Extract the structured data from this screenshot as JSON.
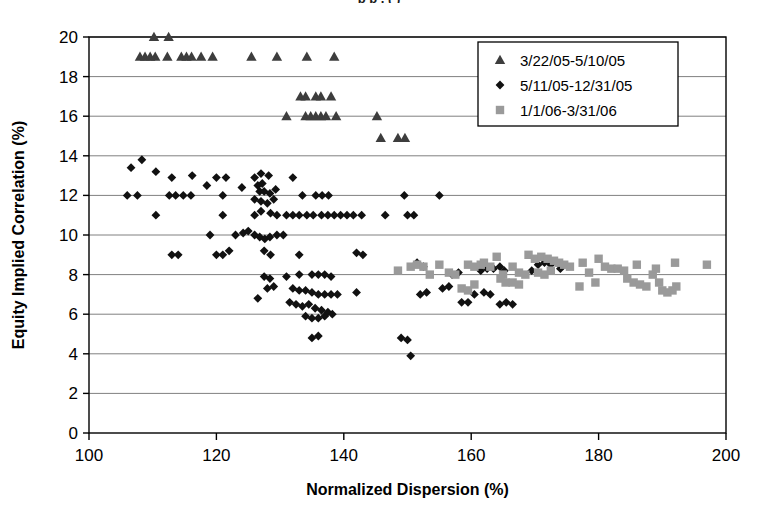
{
  "figure": {
    "clipped_caption": "p                     p                                      ,              (                      )",
    "background_color": "#ffffff",
    "plot_border_color": "#000000",
    "gridline_color": "#808080"
  },
  "chart_data": {
    "type": "scatter",
    "title": "",
    "xlabel": "Normalized Dispersion (%)",
    "ylabel": "Equity Implied Correlation (%)",
    "xlim": [
      100,
      200
    ],
    "ylim": [
      0,
      20
    ],
    "xticks": [
      100,
      120,
      140,
      160,
      180,
      200
    ],
    "yticks": [
      0,
      2,
      4,
      6,
      8,
      10,
      12,
      14,
      16,
      18,
      20
    ],
    "xtick_labels": [
      "100",
      "120",
      "140",
      "160",
      "180",
      "200"
    ],
    "ytick_labels": [
      "0",
      "2",
      "4",
      "6",
      "8",
      "10",
      "12",
      "14",
      "16",
      "18",
      "20"
    ],
    "grid": "horizontal-major-every-2",
    "legend_position": "top-right-inside",
    "series": [
      {
        "name": "3/22/05-5/10/05",
        "marker": "triangle",
        "color": "#3d3d3d",
        "points": [
          [
            110.2,
            20.0
          ],
          [
            112.5,
            20.0
          ],
          [
            108.0,
            19.0
          ],
          [
            108.8,
            19.0
          ],
          [
            109.6,
            19.0
          ],
          [
            110.4,
            19.0
          ],
          [
            112.3,
            19.0
          ],
          [
            114.5,
            19.0
          ],
          [
            115.3,
            19.0
          ],
          [
            116.1,
            19.0
          ],
          [
            117.6,
            19.0
          ],
          [
            119.4,
            19.0
          ],
          [
            125.5,
            19.0
          ],
          [
            129.5,
            19.0
          ],
          [
            134.2,
            19.0
          ],
          [
            138.5,
            19.0
          ],
          [
            133.2,
            17.0
          ],
          [
            134.0,
            17.0
          ],
          [
            135.6,
            17.0
          ],
          [
            136.4,
            17.0
          ],
          [
            138.0,
            17.0
          ],
          [
            131.0,
            16.0
          ],
          [
            134.0,
            16.0
          ],
          [
            134.8,
            16.0
          ],
          [
            135.6,
            16.0
          ],
          [
            136.4,
            16.0
          ],
          [
            137.2,
            16.0
          ],
          [
            138.8,
            16.0
          ],
          [
            145.2,
            16.0
          ],
          [
            145.8,
            14.9
          ],
          [
            148.5,
            14.9
          ],
          [
            149.6,
            14.9
          ]
        ]
      },
      {
        "name": "5/11/05-12/31/05",
        "marker": "diamond",
        "color": "#111111",
        "points": [
          [
            106.6,
            13.4
          ],
          [
            108.3,
            13.8
          ],
          [
            110.5,
            13.2
          ],
          [
            113.0,
            12.9
          ],
          [
            116.2,
            13.0
          ],
          [
            120.0,
            12.9
          ],
          [
            121.5,
            12.9
          ],
          [
            126.0,
            12.9
          ],
          [
            127.0,
            13.1
          ],
          [
            128.2,
            13.0
          ],
          [
            132.0,
            12.9
          ],
          [
            118.5,
            12.5
          ],
          [
            124.0,
            12.4
          ],
          [
            126.5,
            12.5
          ],
          [
            127.2,
            12.6
          ],
          [
            126.8,
            12.2
          ],
          [
            127.5,
            12.2
          ],
          [
            128.4,
            12.1
          ],
          [
            129.3,
            12.3
          ],
          [
            126.0,
            11.8
          ],
          [
            127.0,
            11.7
          ],
          [
            128.0,
            11.6
          ],
          [
            129.0,
            11.8
          ],
          [
            133.5,
            12.0
          ],
          [
            149.5,
            12.0
          ],
          [
            155.0,
            12.0
          ],
          [
            106.0,
            12.0
          ],
          [
            107.6,
            12.0
          ],
          [
            112.6,
            12.0
          ],
          [
            113.6,
            12.0
          ],
          [
            114.8,
            12.0
          ],
          [
            116.0,
            12.0
          ],
          [
            121.0,
            12.0
          ],
          [
            135.6,
            12.0
          ],
          [
            136.6,
            12.0
          ],
          [
            137.6,
            12.0
          ],
          [
            146.5,
            11.0
          ],
          [
            110.5,
            11.0
          ],
          [
            121.0,
            11.0
          ],
          [
            126.0,
            11.0
          ],
          [
            127.0,
            11.2
          ],
          [
            128.5,
            11.1
          ],
          [
            129.5,
            11.0
          ],
          [
            131.0,
            11.0
          ],
          [
            132.0,
            11.0
          ],
          [
            133.0,
            11.0
          ],
          [
            134.2,
            11.0
          ],
          [
            135.2,
            11.0
          ],
          [
            136.5,
            11.0
          ],
          [
            137.5,
            11.0
          ],
          [
            138.5,
            11.0
          ],
          [
            139.5,
            11.0
          ],
          [
            140.5,
            11.0
          ],
          [
            141.5,
            11.0
          ],
          [
            142.8,
            11.0
          ],
          [
            150.0,
            11.0
          ],
          [
            151.0,
            11.0
          ],
          [
            119.0,
            10.0
          ],
          [
            123.0,
            10.0
          ],
          [
            124.2,
            10.1
          ],
          [
            125.0,
            10.2
          ],
          [
            126.0,
            10.0
          ],
          [
            126.8,
            9.9
          ],
          [
            127.6,
            9.8
          ],
          [
            128.4,
            9.9
          ],
          [
            129.5,
            10.0
          ],
          [
            130.5,
            10.0
          ],
          [
            113.0,
            9.0
          ],
          [
            114.0,
            9.0
          ],
          [
            120.0,
            9.0
          ],
          [
            121.0,
            9.0
          ],
          [
            122.0,
            9.2
          ],
          [
            127.5,
            9.2
          ],
          [
            128.5,
            9.0
          ],
          [
            133.0,
            9.0
          ],
          [
            142.0,
            9.1
          ],
          [
            143.0,
            9.0
          ],
          [
            151.5,
            8.6
          ],
          [
            152.5,
            8.4
          ],
          [
            157.0,
            8.0
          ],
          [
            158.0,
            8.1
          ],
          [
            161.5,
            8.2
          ],
          [
            162.5,
            8.3
          ],
          [
            163.5,
            8.3
          ],
          [
            164.5,
            8.4
          ],
          [
            165.2,
            8.2
          ],
          [
            170.5,
            8.5
          ],
          [
            171.5,
            8.6
          ],
          [
            172.5,
            8.5
          ],
          [
            173.5,
            8.6
          ],
          [
            174.0,
            8.3
          ],
          [
            169.5,
            8.2
          ],
          [
            127.5,
            7.9
          ],
          [
            128.4,
            7.8
          ],
          [
            131.0,
            7.9
          ],
          [
            133.0,
            8.0
          ],
          [
            135.0,
            8.0
          ],
          [
            136.0,
            8.0
          ],
          [
            137.0,
            8.0
          ],
          [
            138.0,
            7.9
          ],
          [
            126.5,
            6.8
          ],
          [
            128.0,
            7.3
          ],
          [
            129.0,
            7.4
          ],
          [
            132.0,
            7.3
          ],
          [
            133.0,
            7.2
          ],
          [
            134.0,
            7.2
          ],
          [
            135.0,
            7.1
          ],
          [
            136.0,
            7.0
          ],
          [
            137.0,
            7.0
          ],
          [
            138.0,
            7.0
          ],
          [
            131.5,
            6.6
          ],
          [
            132.5,
            6.5
          ],
          [
            133.5,
            6.4
          ],
          [
            134.5,
            6.5
          ],
          [
            135.5,
            6.3
          ],
          [
            136.5,
            6.2
          ],
          [
            137.5,
            6.1
          ],
          [
            138.2,
            6.0
          ],
          [
            134.0,
            5.9
          ],
          [
            135.0,
            5.8
          ],
          [
            136.0,
            5.8
          ],
          [
            137.0,
            5.9
          ],
          [
            135.0,
            4.8
          ],
          [
            136.0,
            4.9
          ],
          [
            149.0,
            4.8
          ],
          [
            150.0,
            4.7
          ],
          [
            150.5,
            3.9
          ],
          [
            139.0,
            7.0
          ],
          [
            142.0,
            7.1
          ],
          [
            152.0,
            7.0
          ],
          [
            153.0,
            7.1
          ],
          [
            155.5,
            7.3
          ],
          [
            156.5,
            7.4
          ],
          [
            158.5,
            6.6
          ],
          [
            159.5,
            6.6
          ],
          [
            160.5,
            7.0
          ],
          [
            162.0,
            7.1
          ],
          [
            163.0,
            7.0
          ],
          [
            164.5,
            6.5
          ],
          [
            165.5,
            6.6
          ],
          [
            166.5,
            6.5
          ]
        ]
      },
      {
        "name": "1/1/06-3/31/06",
        "marker": "square",
        "color": "#9a9a9a",
        "points": [
          [
            151.5,
            8.5
          ],
          [
            152.5,
            8.4
          ],
          [
            153.5,
            8.0
          ],
          [
            155.0,
            8.5
          ],
          [
            156.5,
            8.1
          ],
          [
            157.5,
            8.0
          ],
          [
            159.5,
            8.5
          ],
          [
            160.5,
            8.4
          ],
          [
            161.5,
            8.5
          ],
          [
            162.0,
            8.6
          ],
          [
            163.0,
            8.4
          ],
          [
            164.0,
            8.9
          ],
          [
            165.0,
            8.0
          ],
          [
            164.6,
            7.8
          ],
          [
            165.4,
            7.6
          ],
          [
            166.5,
            8.4
          ],
          [
            167.5,
            8.1
          ],
          [
            168.5,
            8.0
          ],
          [
            169.0,
            9.0
          ],
          [
            170.0,
            8.8
          ],
          [
            171.0,
            8.9
          ],
          [
            172.0,
            8.8
          ],
          [
            173.0,
            8.7
          ],
          [
            173.8,
            8.6
          ],
          [
            174.6,
            8.5
          ],
          [
            170.5,
            8.1
          ],
          [
            171.5,
            8.0
          ],
          [
            172.5,
            8.2
          ],
          [
            158.5,
            7.3
          ],
          [
            159.5,
            7.2
          ],
          [
            160.5,
            7.5
          ],
          [
            166.5,
            7.6
          ],
          [
            167.5,
            7.5
          ],
          [
            175.5,
            8.4
          ],
          [
            177.5,
            8.6
          ],
          [
            180.0,
            8.8
          ],
          [
            181.0,
            8.4
          ],
          [
            182.0,
            8.3
          ],
          [
            183.0,
            8.3
          ],
          [
            184.0,
            8.2
          ],
          [
            184.5,
            7.8
          ],
          [
            185.5,
            7.6
          ],
          [
            186.5,
            7.5
          ],
          [
            187.5,
            7.4
          ],
          [
            188.5,
            8.0
          ],
          [
            189.5,
            7.6
          ],
          [
            190.0,
            7.2
          ],
          [
            190.8,
            7.1
          ],
          [
            191.6,
            7.2
          ],
          [
            192.2,
            7.4
          ],
          [
            186.0,
            8.5
          ],
          [
            189.0,
            8.3
          ],
          [
            192.0,
            8.6
          ],
          [
            197.0,
            8.5
          ],
          [
            177.0,
            7.4
          ],
          [
            178.5,
            8.1
          ],
          [
            179.5,
            7.6
          ],
          [
            150.5,
            8.4
          ],
          [
            148.5,
            8.2
          ]
        ]
      }
    ]
  },
  "legend": {
    "items": [
      {
        "label": "3/22/05-5/10/05",
        "marker": "triangle",
        "color": "#3d3d3d"
      },
      {
        "label": "5/11/05-12/31/05",
        "marker": "diamond",
        "color": "#111111"
      },
      {
        "label": "1/1/06-3/31/06",
        "marker": "square",
        "color": "#9a9a9a"
      }
    ]
  }
}
